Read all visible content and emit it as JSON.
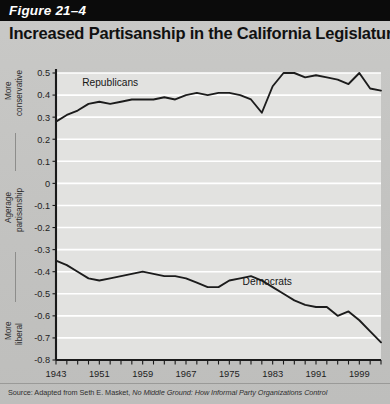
{
  "figure": {
    "number_label": "Figure 21–4",
    "title": "Increased Partisanship in the California Legislature"
  },
  "source": {
    "prefix": "Source: Adapted from Seth E. Masket, ",
    "italic_title": "No Middle Ground: How Informal Party Organizations Control",
    "suffix": ""
  },
  "annotations": {
    "top_left_line1": "More",
    "top_left_line2": "conservative",
    "middle_left_line1": "Agerage",
    "middle_left_line2": "partisanship",
    "bottom_left_line1": "More",
    "bottom_left_line2": "liberal"
  },
  "colors": {
    "band_background": "#0b0b0b",
    "band_text": "#ffffff",
    "page_background": "#c6c6c4",
    "plot_background": "#e2e2e0",
    "gridline": "#ffffff",
    "axis": "#1a1a1a",
    "series_line": "#1c1c1c",
    "title_text": "#111111"
  },
  "chart_data": {
    "type": "line",
    "title": "Increased Partisanship in the California Legislature",
    "xlabel": "",
    "ylabel": "Agerage partisanship",
    "xlim": [
      1943,
      2003
    ],
    "ylim": [
      -0.8,
      0.5
    ],
    "grid": true,
    "grid_axis": "y",
    "legend": "inline-labels",
    "ytick_labels": [
      "0.5",
      "0.4",
      "0.3",
      "0.2",
      "0.1",
      "0",
      "-0.1",
      "-0.2",
      "-0.3",
      "-0.4",
      "-0.5",
      "-0.6",
      "-0.7",
      "-0.8"
    ],
    "yticks": [
      0.5,
      0.4,
      0.3,
      0.2,
      0.1,
      0,
      -0.1,
      -0.2,
      -0.3,
      -0.4,
      -0.5,
      -0.6,
      -0.7,
      -0.8
    ],
    "xtick_labels": [
      "1943",
      "1951",
      "1959",
      "1967",
      "1975",
      "1983",
      "1991",
      "1999"
    ],
    "xticks_labeled": [
      1943,
      1951,
      1959,
      1967,
      1975,
      1983,
      1991,
      1999
    ],
    "xtick_minor_step": 2,
    "x": [
      1943,
      1945,
      1947,
      1949,
      1951,
      1953,
      1955,
      1957,
      1959,
      1961,
      1963,
      1965,
      1967,
      1969,
      1971,
      1973,
      1975,
      1977,
      1979,
      1981,
      1983,
      1985,
      1987,
      1989,
      1991,
      1993,
      1995,
      1997,
      1999,
      2001,
      2003
    ],
    "series": [
      {
        "name": "Republicans",
        "label": "Republicans",
        "label_x": 1953,
        "label_y": 0.44,
        "values": [
          0.28,
          0.31,
          0.33,
          0.36,
          0.37,
          0.36,
          0.37,
          0.38,
          0.38,
          0.38,
          0.39,
          0.38,
          0.4,
          0.41,
          0.4,
          0.41,
          0.41,
          0.4,
          0.38,
          0.32,
          0.44,
          0.5,
          0.5,
          0.48,
          0.49,
          0.48,
          0.47,
          0.45,
          0.5,
          0.43,
          0.42
        ]
      },
      {
        "name": "Democrats",
        "label": "Democrats",
        "label_x": 1982,
        "label_y": -0.46,
        "values": [
          -0.35,
          -0.37,
          -0.4,
          -0.43,
          -0.44,
          -0.43,
          -0.42,
          -0.41,
          -0.4,
          -0.41,
          -0.42,
          -0.42,
          -0.43,
          -0.45,
          -0.47,
          -0.47,
          -0.44,
          -0.43,
          -0.42,
          -0.44,
          -0.47,
          -0.5,
          -0.53,
          -0.55,
          -0.56,
          -0.56,
          -0.6,
          -0.58,
          -0.62,
          -0.67,
          -0.72
        ]
      }
    ]
  }
}
